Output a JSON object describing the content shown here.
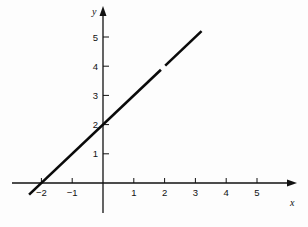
{
  "chart_data": {
    "type": "line",
    "title": "",
    "xlabel": "x",
    "ylabel": "y",
    "equation": "y = x + 2",
    "xlim": [
      -3,
      6
    ],
    "ylim": [
      -1,
      6
    ],
    "grid": false,
    "legend": null,
    "x_ticks": [
      -2,
      -1,
      1,
      2,
      3,
      4,
      5
    ],
    "x_tick_labels": [
      "−2",
      "−1",
      "1",
      "2",
      "3",
      "4",
      "5"
    ],
    "y_ticks": [
      1,
      2,
      3,
      4,
      5
    ],
    "y_tick_labels": [
      "1",
      "2",
      "3",
      "4",
      "5"
    ],
    "series": [
      {
        "name": "line",
        "x": [
          -2.4,
          -2,
          0,
          2,
          3.2
        ],
        "y": [
          -0.4,
          0,
          2,
          4,
          5.2
        ]
      }
    ],
    "annotations": [
      "small gap in line near (2, 4)"
    ],
    "colors": {
      "axis": "#111111",
      "line": "#0a0a0a",
      "background": "#fdfdfd"
    }
  }
}
